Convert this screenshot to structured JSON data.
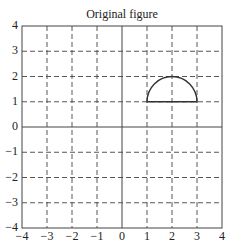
{
  "chart_data": {
    "type": "line",
    "title": "Original figure",
    "xlabel": "",
    "ylabel": "",
    "xlim": [
      -4,
      4
    ],
    "ylim": [
      -4,
      4
    ],
    "grid": true,
    "grid_style": "dashed",
    "x_ticks": [
      -4,
      -3,
      -2,
      -1,
      0,
      1,
      2,
      3,
      4
    ],
    "y_ticks": [
      -4,
      -3,
      -2,
      -1,
      0,
      1,
      2,
      3,
      4
    ],
    "x_tick_labels": [
      "−4",
      "−3",
      "−2",
      "−1",
      "0",
      "1",
      "2",
      "3",
      "4"
    ],
    "y_tick_labels": [
      "4",
      "3",
      "2",
      "1",
      "0",
      "−1",
      "−2",
      "−3",
      "−4"
    ],
    "axes_lines": {
      "x_axis_at": 0,
      "y_axis_at": 0
    },
    "legend": null,
    "series": [
      {
        "name": "semicircle",
        "shape": "closed half-disk outline",
        "center": [
          2,
          1
        ],
        "radius": 1,
        "arc_from_deg": 0,
        "arc_to_deg": 180,
        "base_segment": [
          [
            1,
            1
          ],
          [
            3,
            1
          ]
        ],
        "color": "#333333"
      }
    ]
  },
  "colors": {
    "line": "#333333",
    "grid": "#444444",
    "background": "#ffffff"
  }
}
